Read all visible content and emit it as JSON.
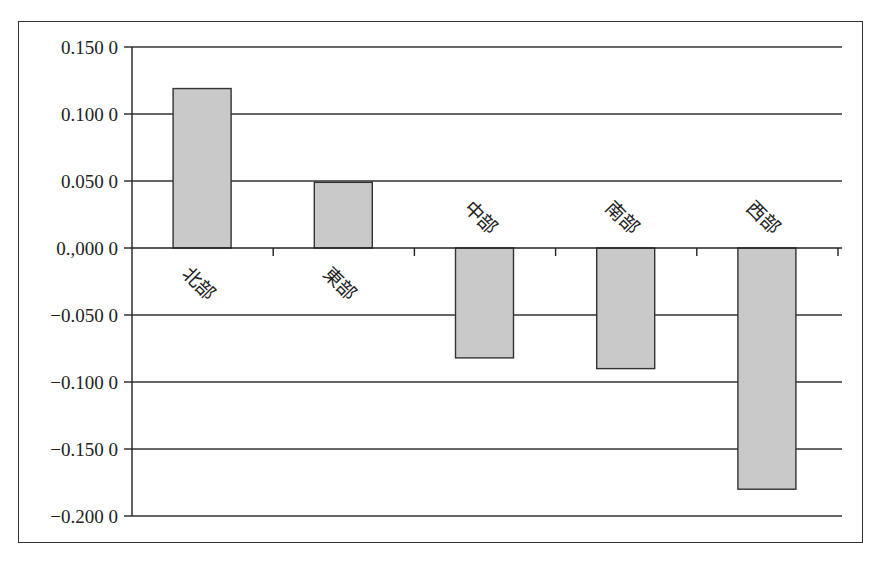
{
  "chart_data": {
    "type": "bar",
    "title": "",
    "xlabel": "",
    "ylabel": "",
    "categories": [
      "北部",
      "東部",
      "中部",
      "南部",
      "西部"
    ],
    "values": [
      0.119,
      0.049,
      -0.082,
      -0.09,
      -0.18
    ],
    "ylim": [
      -0.2,
      0.15
    ],
    "yticks": [
      0.15,
      0.1,
      0.05,
      0.0,
      -0.05,
      -0.1,
      -0.15,
      -0.2
    ],
    "ytick_labels": [
      "0.150 0",
      "0.100 0",
      "0.050 0",
      "0.,000 0",
      "−0.050 0",
      "−0.100 0",
      "−0.150 0",
      "−0.200 0"
    ],
    "grid": true,
    "legend": null,
    "bar_color": "#c9c9c9",
    "bar_edge_color": "#333333",
    "category_label_rotation": -45
  }
}
